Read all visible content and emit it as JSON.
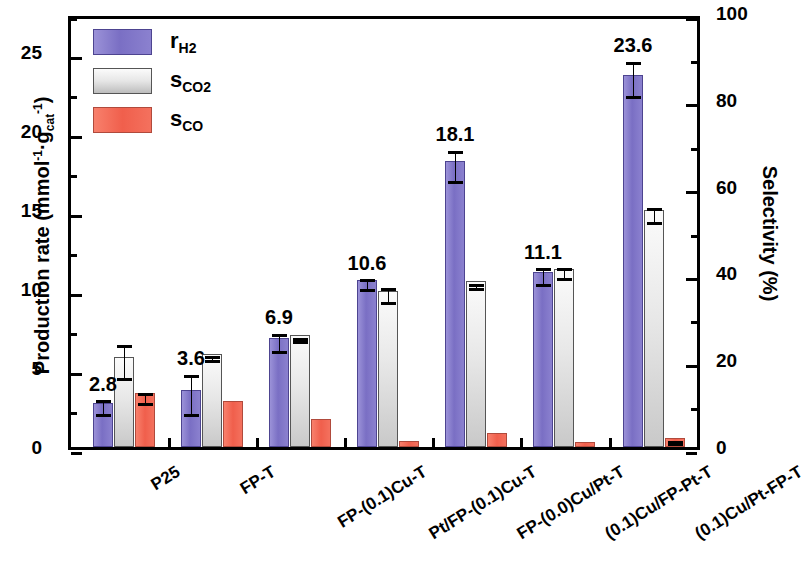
{
  "chart_data": {
    "type": "bar",
    "title": "",
    "xlabel": "",
    "ylabel": "Production rate (mmol·h⁻¹·g_cat⁻¹)",
    "ylabel_right": "Selectivity (%)",
    "ylim": [
      0,
      27.5
    ],
    "ylim_right": [
      0,
      100
    ],
    "yticks": [
      0,
      5,
      10,
      15,
      20,
      25
    ],
    "yticks_right": [
      0,
      20,
      40,
      60,
      80,
      100
    ],
    "minor_ticks": true,
    "grid": false,
    "legend_position": "upper-left",
    "categories": [
      "P25",
      "FP-T",
      "FP-(0.1)Cu-T",
      "Pt/FP-(0.1)Cu-T",
      "FP-(0.0)Cu/Pt-T",
      "(0.1)Cu/FP-Pt-T",
      "(0.1)Cu/Pt-FP-T"
    ],
    "series": [
      {
        "name": "r_H2",
        "legend_label": "r",
        "legend_sub": "H2",
        "axis": "left",
        "unit": "mmol·h⁻¹·g_cat⁻¹",
        "color": "#8278c8",
        "values": [
          2.8,
          3.6,
          6.9,
          10.6,
          18.1,
          11.1,
          23.6
        ],
        "errors": [
          0.45,
          1.25,
          0.55,
          0.3,
          0.95,
          0.5,
          1.1
        ],
        "data_labels": [
          "2.8",
          "3.6",
          "6.9",
          "10.6",
          "18.1",
          "11.1",
          "23.6"
        ]
      },
      {
        "name": "s_CO2",
        "legend_label": "s",
        "legend_sub": "CO2",
        "axis": "right",
        "unit": "%",
        "color": "#d8d8d8",
        "values_left_scale": [
          5.7,
          5.9,
          7.1,
          9.9,
          10.5,
          11.3,
          15.0
        ],
        "values_selectivity": [
          20.7,
          21.5,
          25.8,
          36.0,
          38.2,
          41.1,
          54.5
        ],
        "errors": [
          1.05,
          0.12,
          0.12,
          0.45,
          0.12,
          0.3,
          0.45
        ]
      },
      {
        "name": "s_CO",
        "legend_label": "s",
        "legend_sub": "CO",
        "axis": "right",
        "unit": "%",
        "color": "#f4715e",
        "values_left_scale": [
          3.4,
          2.9,
          1.8,
          0.4,
          0.9,
          0.3,
          0.6
        ],
        "values_selectivity": [
          12.4,
          10.5,
          6.5,
          1.5,
          3.3,
          1.1,
          2.2
        ],
        "errors": [
          0.3,
          0.0,
          0.0,
          0.0,
          0.0,
          0.0,
          0.08
        ]
      }
    ]
  },
  "axes": {
    "left": {
      "title_main": "Production rate (mmol",
      "title_sup1": "-1",
      "title_mid": "·h",
      "title_mid2": "·g",
      "title_sub": "cat",
      "title_sup2": "-1",
      "title_close": ")",
      "tick_labels": [
        "0",
        "5",
        "10",
        "15",
        "20",
        "25"
      ]
    },
    "right": {
      "title": "Selectivity (%)",
      "tick_labels": [
        "0",
        "20",
        "40",
        "60",
        "80",
        "100"
      ]
    }
  },
  "legend": {
    "items": [
      {
        "label": "r",
        "sub": "H2",
        "swatch": "rh2"
      },
      {
        "label": "s",
        "sub": "CO2",
        "swatch": "sco2"
      },
      {
        "label": "s",
        "sub": "CO",
        "swatch": "sco"
      }
    ]
  }
}
